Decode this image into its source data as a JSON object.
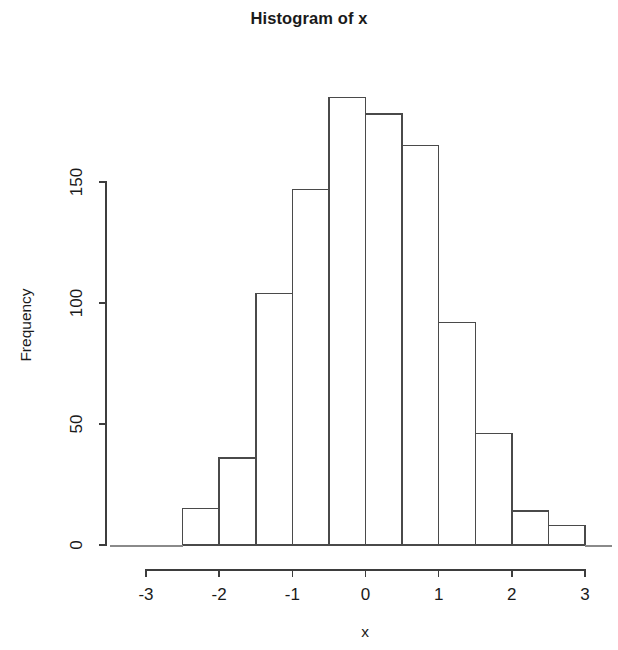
{
  "chart_data": {
    "type": "bar",
    "title": "Histogram of x",
    "xlabel": "x",
    "ylabel": "Frequency",
    "xlim": [
      -3.2,
      3.2
    ],
    "ylim": [
      0,
      190
    ],
    "grid": false,
    "legend": null,
    "bin_width": 0.5,
    "bin_edges": [
      -2.5,
      -2.0,
      -1.5,
      -1.0,
      -0.5,
      0.0,
      0.5,
      1.0,
      1.5,
      2.0,
      2.5,
      3.0
    ],
    "bin_centers": [
      -2.25,
      -1.75,
      -1.25,
      -0.75,
      -0.25,
      0.25,
      0.75,
      1.25,
      1.75,
      2.25,
      2.75
    ],
    "categories": [
      "[-2.5,-2.0)",
      "[-2.0,-1.5)",
      "[-1.5,-1.0)",
      "[-1.0,-0.5)",
      "[-0.5,0.0)",
      "[0.0,0.5)",
      "[0.5,1.0)",
      "[1.0,1.5)",
      "[1.5,2.0)",
      "[2.0,2.5)",
      "[2.5,3.0)"
    ],
    "values": [
      15,
      36,
      104,
      147,
      185,
      178,
      165,
      92,
      46,
      14,
      8
    ],
    "x_ticks": [
      -3,
      -2,
      -1,
      0,
      1,
      2,
      3
    ],
    "x_tick_labels": [
      "-3",
      "-2",
      "-1",
      "0",
      "1",
      "2",
      "3"
    ],
    "y_ticks": [
      0,
      50,
      100,
      150
    ],
    "y_tick_labels": [
      "0",
      "50",
      "100",
      "150"
    ],
    "bar_fill_color": "#ffffff",
    "bar_border_color": "#4a4a4a",
    "axis_color": "#3d3d3d",
    "background_color": "#ffffff"
  },
  "axes": {
    "x_title": "x",
    "y_title": "Frequency"
  },
  "title": {
    "text": "Histogram of x"
  }
}
